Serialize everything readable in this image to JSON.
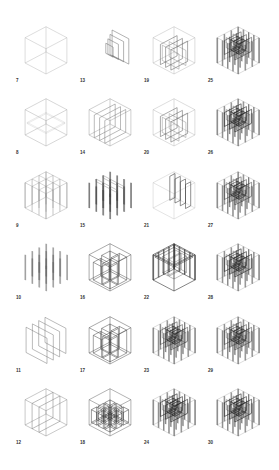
{
  "title": "",
  "layout": {
    "columns": 4,
    "rows": 6
  },
  "colors": {
    "line": "#8a8a8a",
    "dark": "#333333",
    "background": "#ffffff"
  },
  "studies": [
    {
      "label": "7",
      "col": 0,
      "row": 0,
      "type": "cube-frame"
    },
    {
      "label": "8",
      "col": 0,
      "row": 1,
      "type": "cube-open"
    },
    {
      "label": "9",
      "col": 0,
      "row": 2,
      "type": "grid-frame"
    },
    {
      "label": "10",
      "col": 0,
      "row": 3,
      "type": "columns"
    },
    {
      "label": "11",
      "col": 0,
      "row": 4,
      "type": "parallel-walls"
    },
    {
      "label": "12",
      "col": 0,
      "row": 5,
      "type": "walled-box"
    },
    {
      "label": "13",
      "col": 1,
      "row": 0,
      "type": "staggered-walls"
    },
    {
      "label": "14",
      "col": 1,
      "row": 1,
      "type": "bays"
    },
    {
      "label": "15",
      "col": 1,
      "row": 2,
      "type": "columns-walls"
    },
    {
      "label": "16",
      "col": 1,
      "row": 3,
      "type": "nested-boxes"
    },
    {
      "label": "17",
      "col": 1,
      "row": 4,
      "type": "nested-boxes"
    },
    {
      "label": "18",
      "col": 1,
      "row": 5,
      "type": "cells"
    },
    {
      "label": "19",
      "col": 2,
      "row": 0,
      "type": "grid-walls"
    },
    {
      "label": "20",
      "col": 2,
      "row": 1,
      "type": "grid-walls"
    },
    {
      "label": "21",
      "col": 2,
      "row": 2,
      "type": "wall-panels"
    },
    {
      "label": "22",
      "col": 2,
      "row": 3,
      "type": "dense-box"
    },
    {
      "label": "23",
      "col": 2,
      "row": 4,
      "type": "dense-grid"
    },
    {
      "label": "24",
      "col": 2,
      "row": 5,
      "type": "dense-grid"
    },
    {
      "label": "25",
      "col": 3,
      "row": 0,
      "type": "dense-grid"
    },
    {
      "label": "26",
      "col": 3,
      "row": 1,
      "type": "dense-grid"
    },
    {
      "label": "27",
      "col": 3,
      "row": 2,
      "type": "dense-grid"
    },
    {
      "label": "28",
      "col": 3,
      "row": 3,
      "type": "dense-grid"
    },
    {
      "label": "29",
      "col": 3,
      "row": 4,
      "type": "dense-grid"
    },
    {
      "label": "30",
      "col": 3,
      "row": 5,
      "type": "dense-grid"
    }
  ]
}
